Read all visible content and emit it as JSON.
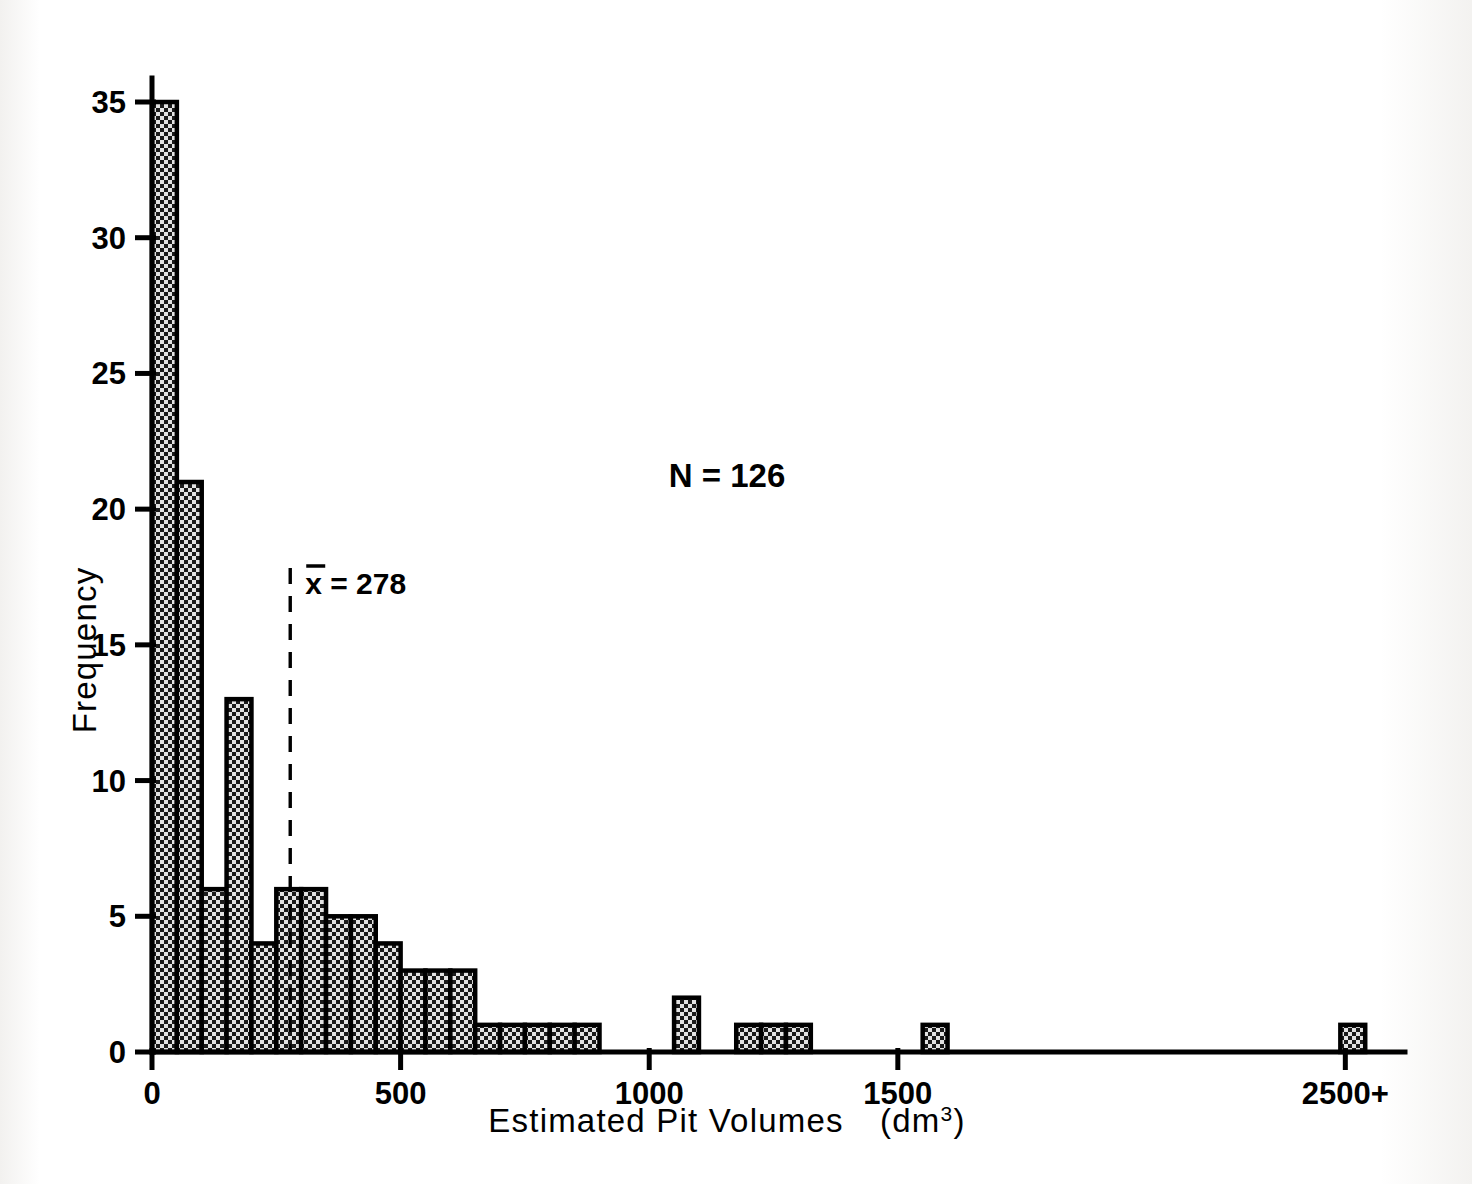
{
  "figure": {
    "name": "estimated-pit-volumes-histogram",
    "background_color": "#ffffff",
    "ink_color": "#000000",
    "bar_fill_color": "#d8d8d8"
  },
  "annotations": {
    "sample_size_label": "N = 126",
    "mean_label": "x = 278",
    "mean_symbol": "x",
    "mean_value_text": "= 278",
    "mean_value": 278
  },
  "axes": {
    "x": {
      "label_main": "Estimated Pit Volumes",
      "label_units": "(dm",
      "label_units_sup": "3",
      "label_units_close": ")",
      "label_full": "Estimated Pit Volumes  (dm3)",
      "tick_labels": [
        "0",
        "500",
        "1000",
        "1500",
        "2500+"
      ],
      "tick_values": [
        0,
        500,
        1000,
        1500,
        2400
      ],
      "range": [
        0,
        2520
      ]
    },
    "y": {
      "label": "Frequency",
      "tick_labels": [
        "0",
        "5",
        "10",
        "15",
        "20",
        "25",
        "30",
        "35"
      ],
      "tick_values": [
        0,
        5,
        10,
        15,
        20,
        25,
        30,
        35
      ],
      "range": [
        0,
        35
      ]
    }
  },
  "chart_data": {
    "type": "bar",
    "title": "",
    "subtitle": "",
    "xlabel": "Estimated Pit Volumes (dm3)",
    "ylabel": "Frequency",
    "xlim": [
      0,
      2520
    ],
    "ylim": [
      0,
      35
    ],
    "grid": false,
    "legend": "none",
    "bin_width": 50,
    "n_total": 126,
    "mean": 278,
    "annotations": [
      "N = 126",
      "x̄ = 278"
    ],
    "categories": [
      "0-50",
      "50-100",
      "100-150",
      "150-200",
      "200-250",
      "250-300",
      "300-350",
      "350-400",
      "400-450",
      "450-500",
      "500-550",
      "550-600",
      "600-650",
      "650-700",
      "700-750",
      "750-800",
      "800-850",
      "850-900",
      "1050-1100",
      "1175-1225",
      "1225-1275",
      "1275-1325",
      "1550-1600",
      "2500+"
    ],
    "bin_starts": [
      0,
      50,
      100,
      150,
      200,
      250,
      300,
      350,
      400,
      450,
      500,
      550,
      600,
      650,
      700,
      750,
      800,
      850,
      1050,
      1175,
      1225,
      1275,
      1550,
      2390
    ],
    "values": [
      35,
      21,
      6,
      13,
      4,
      6,
      6,
      5,
      5,
      4,
      3,
      3,
      3,
      1,
      1,
      1,
      1,
      1,
      2,
      1,
      1,
      1,
      1,
      1
    ],
    "series": [
      {
        "name": "Frequency",
        "values": [
          35,
          21,
          6,
          13,
          4,
          6,
          6,
          5,
          5,
          4,
          3,
          3,
          3,
          1,
          1,
          1,
          1,
          1,
          2,
          1,
          1,
          1,
          1,
          1
        ]
      }
    ]
  }
}
